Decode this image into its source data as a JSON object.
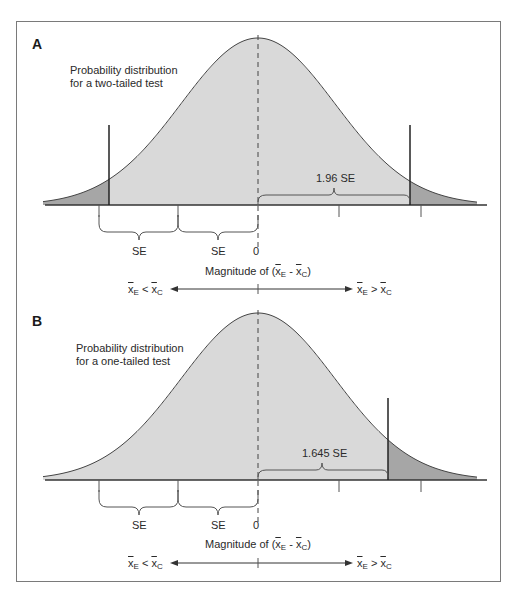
{
  "panels": [
    {
      "letter": "A",
      "title_line1": "Probability distribution",
      "title_line2": "for a two-tailed test",
      "critical_label": "1.96 SE",
      "brace_labels": [
        "SE",
        "SE"
      ],
      "zero_label": "0",
      "axis_label_prefix": "Magnitude of (",
      "axis_label_suffix": ")",
      "direction_left": "x̄E < x̄C",
      "direction_right": "x̄E > x̄C",
      "test_type": "two-tailed"
    },
    {
      "letter": "B",
      "title_line1": "Probability distribution",
      "title_line2": "for a one-tailed test",
      "critical_label": "1.645 SE",
      "brace_labels": [
        "SE",
        "SE"
      ],
      "zero_label": "0",
      "axis_label_prefix": "Magnitude of (",
      "axis_label_suffix": ")",
      "direction_left": "x̄E < x̄C",
      "direction_right": "x̄E > x̄C",
      "test_type": "one-tailed"
    }
  ],
  "colors": {
    "body_fill": "#d9d9d9",
    "tail_fill": "#a6a6a6",
    "line": "#333333",
    "frame": "#7a7a7a"
  }
}
